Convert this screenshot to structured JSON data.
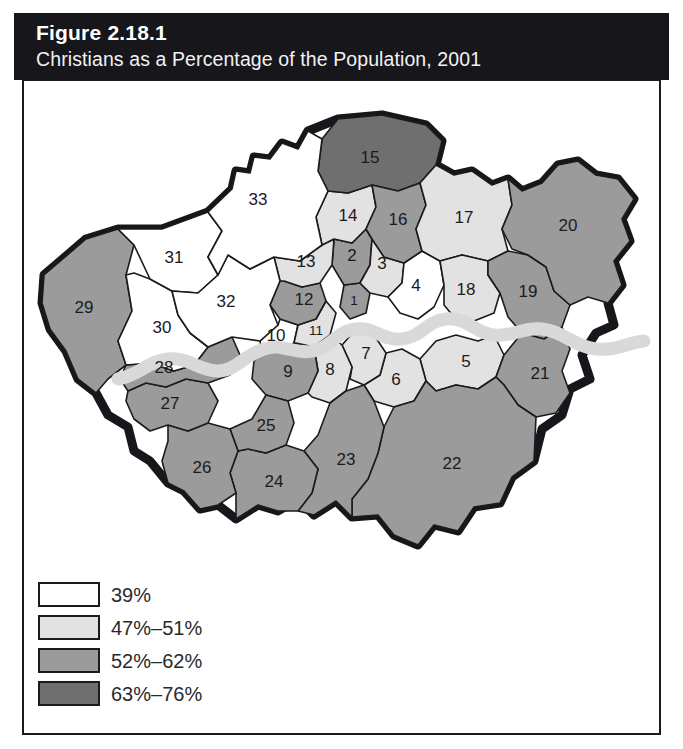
{
  "header": {
    "figure_number": "Figure 2.18.1",
    "subtitle": "Christians as a Percentage of the Population, 2001"
  },
  "legend": {
    "items": [
      {
        "label": "39%",
        "color": "#ffffff"
      },
      {
        "label": "47%–51%",
        "color": "#e2e2e2"
      },
      {
        "label": "52%–62%",
        "color": "#9b9b9b"
      },
      {
        "label": "63%–76%",
        "color": "#6f6f6f"
      }
    ]
  },
  "chart_data": {
    "type": "map",
    "title": "Christians as a Percentage of the Population, 2001",
    "classes": [
      {
        "label": "39%",
        "color": "#ffffff",
        "min": 39,
        "max": 39
      },
      {
        "label": "47%–51%",
        "color": "#e2e2e2",
        "min": 47,
        "max": 51
      },
      {
        "label": "52%–62%",
        "color": "#9b9b9b",
        "min": 52,
        "max": 62
      },
      {
        "label": "63%–76%",
        "color": "#6f6f6f",
        "min": 63,
        "max": 76
      }
    ],
    "river_label": "River Thames",
    "regions": [
      {
        "id": "1",
        "class": 2
      },
      {
        "id": "2",
        "class": 2
      },
      {
        "id": "3",
        "class": 1
      },
      {
        "id": "4",
        "class": 0
      },
      {
        "id": "5",
        "class": 1
      },
      {
        "id": "6",
        "class": 1
      },
      {
        "id": "7",
        "class": 1
      },
      {
        "id": "8",
        "class": 1
      },
      {
        "id": "9",
        "class": 2
      },
      {
        "id": "10",
        "class": 0
      },
      {
        "id": "11",
        "class": 1
      },
      {
        "id": "12",
        "class": 2
      },
      {
        "id": "13",
        "class": 1
      },
      {
        "id": "14",
        "class": 1
      },
      {
        "id": "15",
        "class": 3
      },
      {
        "id": "16",
        "class": 2
      },
      {
        "id": "17",
        "class": 1
      },
      {
        "id": "18",
        "class": 1
      },
      {
        "id": "19",
        "class": 2
      },
      {
        "id": "20",
        "class": 2
      },
      {
        "id": "21",
        "class": 2
      },
      {
        "id": "22",
        "class": 2
      },
      {
        "id": "23",
        "class": 2
      },
      {
        "id": "24",
        "class": 2
      },
      {
        "id": "25",
        "class": 2
      },
      {
        "id": "26",
        "class": 2
      },
      {
        "id": "27",
        "class": 2
      },
      {
        "id": "28",
        "class": 2
      },
      {
        "id": "29",
        "class": 2
      },
      {
        "id": "30",
        "class": 0
      },
      {
        "id": "31",
        "class": 0
      },
      {
        "id": "32",
        "class": 0
      },
      {
        "id": "33",
        "class": 0
      }
    ]
  }
}
